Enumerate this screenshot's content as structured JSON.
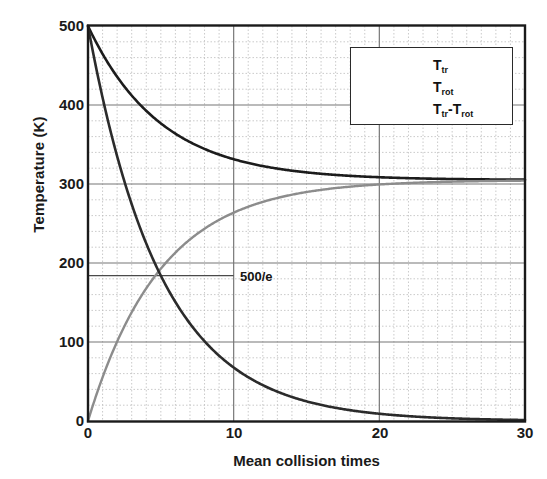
{
  "chart_data": {
    "type": "line",
    "title": "",
    "xlabel": "Mean collision times",
    "ylabel": "Temperature (K)",
    "xlim": [
      0,
      30
    ],
    "ylim": [
      0,
      500
    ],
    "xticks": [
      "0",
      "10",
      "20",
      "30"
    ],
    "xtick_values": [
      0,
      10,
      20,
      30
    ],
    "yticks": [
      "0",
      "100",
      "200",
      "300",
      "400",
      "500"
    ],
    "ytick_values": [
      0,
      100,
      200,
      300,
      400,
      500
    ],
    "grid": "major solid, minor dotted; minor x every 1, minor y every 20",
    "legend_position": "upper right",
    "annotations": [
      {
        "text": "500/e",
        "x": 10.6,
        "y": 184,
        "note": "horizontal marker line drawn from x=0 to x=10 at y=500/e"
      }
    ],
    "marker_lines": [
      {
        "name": "500/e level",
        "orientation": "horizontal",
        "y": 184,
        "x_start": 0,
        "x_end": 10
      }
    ],
    "series": [
      {
        "name": "T_tr",
        "label": "T",
        "sublabel": "tr",
        "color": "#1c1c1c",
        "width": 2.6,
        "model": "305 + 195*exp(-x/5)",
        "x": [
          0,
          1,
          2,
          3,
          4,
          5,
          6,
          7,
          8,
          9,
          10,
          11,
          12,
          13,
          14,
          15,
          16,
          17,
          18,
          19,
          20,
          21,
          22,
          23,
          24,
          25,
          26,
          27,
          28,
          29,
          30
        ],
        "values": [
          500,
          465,
          436,
          412,
          393,
          377,
          364,
          353,
          344,
          337,
          331,
          326,
          323,
          320,
          317,
          315,
          313,
          312,
          311,
          310,
          309,
          308,
          308,
          307,
          307,
          307,
          306,
          306,
          306,
          306,
          306
        ]
      },
      {
        "name": "T_rot",
        "label": "T",
        "sublabel": "rot",
        "color": "#8c8c8c",
        "width": 2.4,
        "model": "305 - 305*exp(-x/5)",
        "x": [
          0,
          1,
          2,
          3,
          4,
          5,
          6,
          7,
          8,
          9,
          10,
          11,
          12,
          13,
          14,
          15,
          16,
          17,
          18,
          19,
          20,
          21,
          22,
          23,
          24,
          25,
          26,
          27,
          28,
          29,
          30
        ],
        "values": [
          0,
          55,
          100,
          138,
          168,
          193,
          213,
          230,
          244,
          255,
          264,
          272,
          277,
          282,
          286,
          290,
          293,
          295,
          297,
          298,
          300,
          301,
          302,
          302,
          303,
          303,
          304,
          304,
          304,
          305,
          305
        ]
      },
      {
        "name": "T_tr - T_rot",
        "label": "T",
        "sublabel": "tr",
        "label2": "-T",
        "sublabel2": "rot",
        "color": "#2b2b2b",
        "width": 2.6,
        "model": "500*exp(-x/5)",
        "x": [
          0,
          1,
          2,
          3,
          4,
          5,
          6,
          7,
          8,
          9,
          10,
          11,
          12,
          13,
          14,
          15,
          16,
          17,
          18,
          19,
          20,
          21,
          22,
          23,
          24,
          25,
          26,
          27,
          28,
          29,
          30
        ],
        "values": [
          500,
          409,
          335,
          274,
          225,
          184,
          151,
          123,
          101,
          83,
          68,
          55,
          45,
          37,
          30,
          25,
          20,
          17,
          14,
          11,
          9,
          7.5,
          6.1,
          5.0,
          4.1,
          3.4,
          2.8,
          2.3,
          1.9,
          1.5,
          1.2
        ]
      }
    ]
  },
  "legend": {
    "entries": [
      {
        "text": "T",
        "sub": "tr",
        "text2": "",
        "sub2": ""
      },
      {
        "text": "T",
        "sub": "rot",
        "text2": "",
        "sub2": ""
      },
      {
        "text": "T",
        "sub": "tr",
        "text2": "-T",
        "sub2": "rot"
      }
    ]
  },
  "colors": {
    "background": "#ffffff",
    "axis": "#1a1a1a",
    "major_grid": "#777777",
    "minor_grid": "#bcbcbc",
    "t_tr": "#1c1c1c",
    "t_rot": "#8c8c8c",
    "t_diff": "#2b2b2b"
  }
}
